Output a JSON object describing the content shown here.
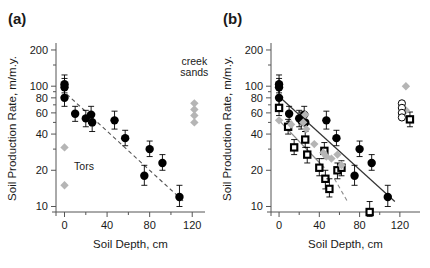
{
  "figure": {
    "width": 430,
    "height": 268,
    "background": "#ffffff",
    "panels": [
      "a",
      "b"
    ]
  },
  "colors": {
    "axis": "#555555",
    "black_marker": "#000000",
    "grey_marker": "#b5b5b5",
    "grey_dark": "#8c8c8c",
    "trend_solid": "#333333",
    "trend_dashed": "#555555",
    "text": "#1a1a1a"
  },
  "panel_a": {
    "tag": "(a)",
    "annotations": [
      {
        "name": "creek-sands-label",
        "text": "creek",
        "x": 122,
        "y": 150
      },
      {
        "name": "creek-sands-label-2",
        "text": "sands",
        "x": 122,
        "y": 122
      },
      {
        "name": "tors-label",
        "text": "Tors",
        "x": 9,
        "y": 20
      }
    ],
    "chart_data": {
      "type": "scatter",
      "title": "(a)",
      "xlabel": "Soil Depth, cm",
      "ylabel": "Soil Production Rate, m/m.y.",
      "xlim": [
        -8,
        132
      ],
      "ylim": [
        9,
        220
      ],
      "yscale": "log",
      "xticks": [
        0,
        40,
        80,
        120
      ],
      "xminorticks": [
        20,
        60,
        100
      ],
      "yticks": [
        10,
        20,
        40,
        60,
        80,
        100,
        200
      ],
      "grid": false,
      "legend": "none",
      "series": [
        {
          "name": "Soil-mantled sites (black circles)",
          "marker": "filled-circle",
          "color": "#000000",
          "points": [
            {
              "x": 0,
              "y": 104,
              "yerr_lo": 16,
              "yerr_hi": 20
            },
            {
              "x": 0,
              "y": 98,
              "yerr_lo": 14,
              "yerr_hi": 18
            },
            {
              "x": 0,
              "y": 80,
              "yerr_lo": 12,
              "yerr_hi": 14
            },
            {
              "x": 10,
              "y": 59,
              "yerr_lo": 8,
              "yerr_hi": 9
            },
            {
              "x": 20,
              "y": 54,
              "yerr_lo": 8,
              "yerr_hi": 9
            },
            {
              "x": 25,
              "y": 58,
              "yerr_lo": 9,
              "yerr_hi": 10
            },
            {
              "x": 26,
              "y": 50,
              "yerr_lo": 8,
              "yerr_hi": 9
            },
            {
              "x": 47,
              "y": 52,
              "yerr_lo": 8,
              "yerr_hi": 10
            },
            {
              "x": 57,
              "y": 37,
              "yerr_lo": 5,
              "yerr_hi": 6
            },
            {
              "x": 75,
              "y": 18,
              "yerr_lo": 3,
              "yerr_hi": 4
            },
            {
              "x": 80,
              "y": 30,
              "yerr_lo": 4,
              "yerr_hi": 5
            },
            {
              "x": 92,
              "y": 23,
              "yerr_lo": 3,
              "yerr_hi": 4
            },
            {
              "x": 108,
              "y": 12,
              "yerr_lo": 2,
              "yerr_hi": 3
            }
          ]
        },
        {
          "name": "Tors (grey diamonds)",
          "marker": "diamond",
          "color": "#b5b5b5",
          "points": [
            {
              "x": 0,
              "y": 31
            },
            {
              "x": 0,
              "y": 15
            }
          ]
        },
        {
          "name": "Creek sands (grey diamonds)",
          "marker": "diamond",
          "color": "#b5b5b5",
          "points": [
            {
              "x": 122,
              "y": 72
            },
            {
              "x": 122,
              "y": 64
            },
            {
              "x": 122,
              "y": 57
            },
            {
              "x": 122,
              "y": 50
            }
          ]
        }
      ],
      "trendlines": [
        {
          "name": "exponential-fit-dashed",
          "style": "dashed",
          "color": "#555555",
          "x1": 2,
          "y1": 86,
          "x2": 112,
          "y2": 11
        }
      ]
    }
  },
  "panel_b": {
    "tag": "(b)",
    "annotations": [],
    "chart_data": {
      "type": "scatter",
      "title": "(b)",
      "xlabel": "Soil Depth, cm",
      "ylabel": "Soil Production Rate, m/m.y.",
      "xlim": [
        -8,
        140
      ],
      "ylim": [
        9,
        220
      ],
      "yscale": "log",
      "xticks": [
        0,
        40,
        80,
        120
      ],
      "xminorticks": [
        20,
        60,
        100
      ],
      "yticks": [
        10,
        20,
        40,
        60,
        80,
        100,
        200
      ],
      "grid": false,
      "legend": "none",
      "series": [
        {
          "name": "Soil production (black circles)",
          "marker": "filled-circle",
          "color": "#000000",
          "points": [
            {
              "x": 0,
              "y": 104,
              "yerr_lo": 16,
              "yerr_hi": 20
            },
            {
              "x": 0,
              "y": 98,
              "yerr_lo": 14,
              "yerr_hi": 18
            },
            {
              "x": 0,
              "y": 80,
              "yerr_lo": 12,
              "yerr_hi": 14
            },
            {
              "x": 10,
              "y": 59,
              "yerr_lo": 8,
              "yerr_hi": 9
            },
            {
              "x": 20,
              "y": 54,
              "yerr_lo": 8,
              "yerr_hi": 9
            },
            {
              "x": 22,
              "y": 52,
              "yerr_lo": 8,
              "yerr_hi": 9
            },
            {
              "x": 25,
              "y": 58,
              "yerr_lo": 9,
              "yerr_hi": 10
            },
            {
              "x": 26,
              "y": 50,
              "yerr_lo": 8,
              "yerr_hi": 9
            },
            {
              "x": 47,
              "y": 52,
              "yerr_lo": 8,
              "yerr_hi": 10
            },
            {
              "x": 57,
              "y": 37,
              "yerr_lo": 5,
              "yerr_hi": 6
            },
            {
              "x": 75,
              "y": 18,
              "yerr_lo": 3,
              "yerr_hi": 4
            },
            {
              "x": 80,
              "y": 30,
              "yerr_lo": 4,
              "yerr_hi": 5
            },
            {
              "x": 92,
              "y": 23,
              "yerr_lo": 3,
              "yerr_hi": 4
            },
            {
              "x": 108,
              "y": 12,
              "yerr_lo": 2,
              "yerr_hi": 3
            }
          ]
        },
        {
          "name": "Corrected rates (black squares)",
          "marker": "square-dot",
          "color": "#000000",
          "points": [
            {
              "x": 0,
              "y": 66,
              "yerr_lo": 9,
              "yerr_hi": 10
            },
            {
              "x": 9,
              "y": 46,
              "yerr_lo": 6,
              "yerr_hi": 7
            },
            {
              "x": 15,
              "y": 31,
              "yerr_lo": 4,
              "yerr_hi": 5
            },
            {
              "x": 26,
              "y": 36,
              "yerr_lo": 5,
              "yerr_hi": 6
            },
            {
              "x": 28,
              "y": 27,
              "yerr_lo": 4,
              "yerr_hi": 4
            },
            {
              "x": 40,
              "y": 21,
              "yerr_lo": 3,
              "yerr_hi": 4
            },
            {
              "x": 45,
              "y": 29,
              "yerr_lo": 4,
              "yerr_hi": 5
            },
            {
              "x": 46,
              "y": 17,
              "yerr_lo": 3,
              "yerr_hi": 3
            },
            {
              "x": 50,
              "y": 14,
              "yerr_lo": 2,
              "yerr_hi": 3
            },
            {
              "x": 58,
              "y": 20,
              "yerr_lo": 3,
              "yerr_hi": 3
            },
            {
              "x": 62,
              "y": 21,
              "yerr_lo": 3,
              "yerr_hi": 3
            },
            {
              "x": 90,
              "y": 9,
              "yerr_lo": 1.5,
              "yerr_hi": 2
            },
            {
              "x": 130,
              "y": 53,
              "yerr_lo": 7,
              "yerr_hi": 8
            }
          ]
        },
        {
          "name": "Grey diamonds",
          "marker": "diamond",
          "color": "#b5b5b5",
          "points": [
            {
              "x": 0,
              "y": 52
            },
            {
              "x": 12,
              "y": 48
            },
            {
              "x": 24,
              "y": 50
            },
            {
              "x": 26,
              "y": 58
            },
            {
              "x": 27,
              "y": 44
            },
            {
              "x": 35,
              "y": 33
            },
            {
              "x": 44,
              "y": 28
            },
            {
              "x": 47,
              "y": 26
            },
            {
              "x": 52,
              "y": 25
            },
            {
              "x": 58,
              "y": 27
            },
            {
              "x": 62,
              "y": 22
            },
            {
              "x": 126,
              "y": 100
            },
            {
              "x": 126,
              "y": 63
            }
          ]
        },
        {
          "name": "Open circles (right cluster)",
          "marker": "open-circle",
          "color": "#000000",
          "points": [
            {
              "x": 122,
              "y": 72
            },
            {
              "x": 122,
              "y": 66
            },
            {
              "x": 122,
              "y": 60
            },
            {
              "x": 122,
              "y": 55
            }
          ]
        }
      ],
      "trendlines": [
        {
          "name": "soil-production-fit-solid",
          "style": "solid",
          "color": "#333333",
          "x1": 0,
          "y1": 82,
          "x2": 115,
          "y2": 11
        },
        {
          "name": "corrected-fit-grey-solid",
          "style": "solid",
          "color": "#8c8c8c",
          "x1": 0,
          "y1": 52,
          "x2": 45,
          "y2": 21
        },
        {
          "name": "lower-dashed-segment",
          "style": "dashed",
          "color": "#8c8c8c",
          "x1": 55,
          "y1": 17,
          "x2": 68,
          "y2": 11
        }
      ]
    }
  }
}
